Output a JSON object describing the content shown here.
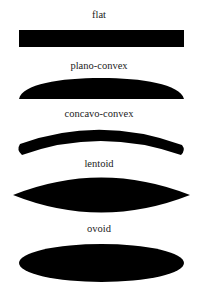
{
  "diagram": {
    "type": "shape-profiles",
    "fill_color": "#000000",
    "background": "#ffffff",
    "shapes": [
      {
        "label": "flat",
        "kind": "rectangle"
      },
      {
        "label": "plano-convex",
        "kind": "plano-convex"
      },
      {
        "label": "concavo-convex",
        "kind": "concavo-convex"
      },
      {
        "label": "lentoid",
        "kind": "lentoid"
      },
      {
        "label": "ovoid",
        "kind": "ellipse"
      }
    ]
  }
}
